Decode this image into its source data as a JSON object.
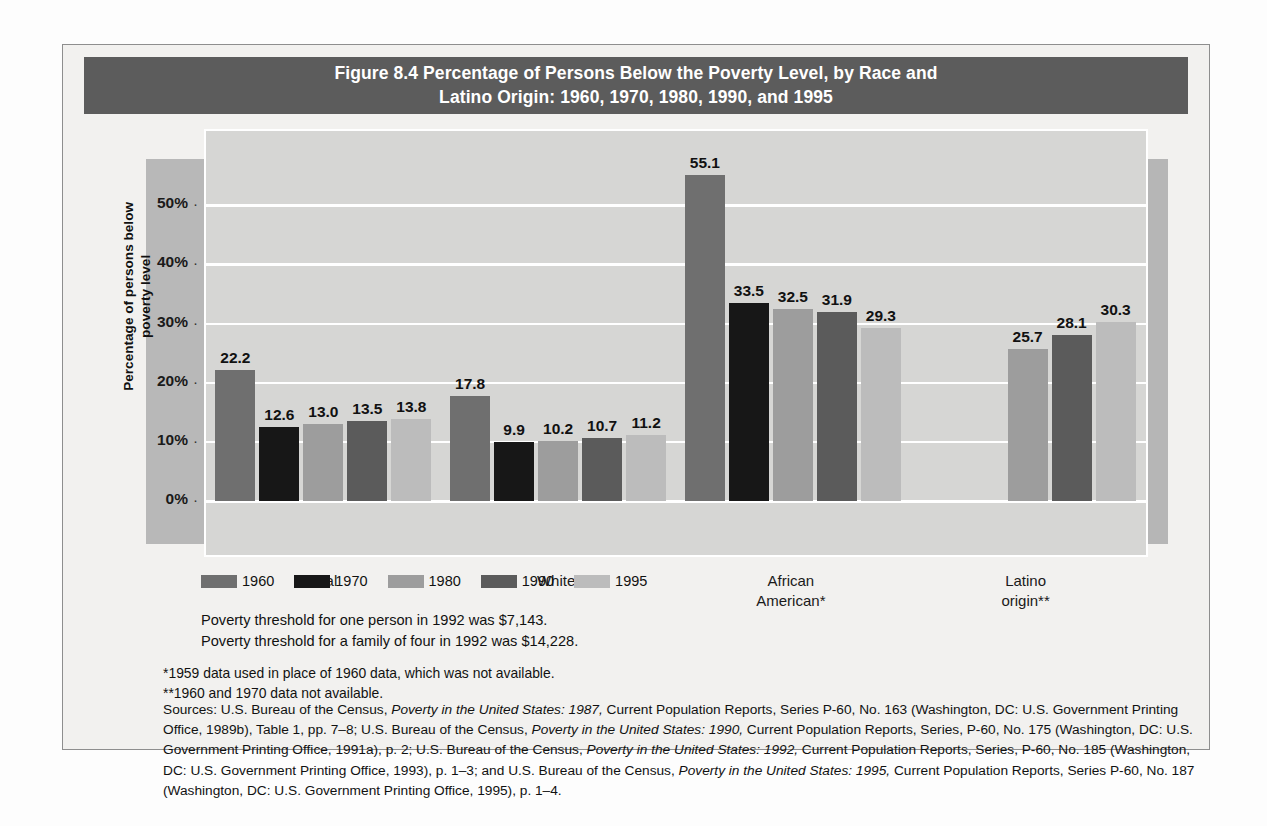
{
  "figure": {
    "title": "Figure 8.4  Percentage of Persons Below the Poverty Level, by Race and Latino Origin: 1960, 1970, 1980, 1990, and 1995",
    "title_line1": "Figure 8.4  Percentage of Persons Below the Poverty Level, by Race and",
    "title_line2": "Latino Origin: 1960, 1970, 1980, 1990, and 1995",
    "title_bg": "#5c5c5c",
    "title_color": "#ffffff"
  },
  "axis": {
    "ylabel_line1": "Percentage of persons below",
    "ylabel_line2": "poverty level",
    "yticks": [
      "0%",
      "10%",
      "20%",
      "30%",
      "40%",
      "50%"
    ],
    "ytick_values": [
      0,
      10,
      20,
      30,
      40,
      50
    ]
  },
  "legend": {
    "items": [
      {
        "label": "1960",
        "color": "#6f6f6f"
      },
      {
        "label": "1970",
        "color": "#171717"
      },
      {
        "label": "1980",
        "color": "#9d9d9d"
      },
      {
        "label": "1990",
        "color": "#5b5b5b"
      },
      {
        "label": "1995",
        "color": "#bcbcbc"
      }
    ]
  },
  "notes": {
    "threshold_line1": "Poverty threshold for one person in 1992 was $7,143.",
    "threshold_line2": "Poverty threshold for a family of four in 1992 was $14,228.",
    "footnote1": "*1959 data used in place of 1960 data, which was not available.",
    "footnote2": "**1960 and 1970 data not available.",
    "sources_prefix": "Sources: U.S. Bureau of the Census, ",
    "sources_it1": "Poverty in the United States: 1987,",
    "sources_t1": " Current Population Reports, Series P-60, No. 163 (Washington, DC: U.S. Government Printing Office, 1989b), Table 1, pp. 7–8; U.S. Bureau of the Census, ",
    "sources_it2": "Poverty in the United States: 1990,",
    "sources_t2": " Current Population Reports, Series, P-60, No. 175 (Washington, DC: U.S. Government Printing Office, 1991a), p. 2; U.S. Bureau of the Census, ",
    "sources_it3": "Poverty in the United States: 1992,",
    "sources_t3": " Current Population Reports, Series, P-60, No. 185 (Washington, DC: U.S. Government Printing Office, 1993), p. 1–3; and U.S. Bureau of the Census, ",
    "sources_it4": "Poverty in the United States: 1995,",
    "sources_t4": " Current Population Reports, Series P-60, No. 187 (Washington, DC: U.S. Government Printing Office, 1995), p. 1–4."
  },
  "chart_data": {
    "type": "bar",
    "title": "Figure 8.4  Percentage of Persons Below the Poverty Level, by Race and Latino Origin: 1960, 1970, 1980, 1990, and 1995",
    "xlabel": "",
    "ylabel": "Percentage of persons below poverty level",
    "ylim": [
      0,
      55
    ],
    "yticks": [
      0,
      10,
      20,
      30,
      40,
      50
    ],
    "ytick_labels": [
      "0%",
      "10%",
      "20%",
      "30%",
      "40%",
      "50%"
    ],
    "grid": true,
    "legend_position": "below-left",
    "categories": [
      "Total",
      "White",
      "African American*",
      "Latino origin**"
    ],
    "series": [
      {
        "name": "1960",
        "color": "#6f6f6f",
        "values": [
          22.2,
          17.8,
          55.1,
          null
        ]
      },
      {
        "name": "1970",
        "color": "#171717",
        "values": [
          12.6,
          9.9,
          33.5,
          null
        ]
      },
      {
        "name": "1980",
        "color": "#9d9d9d",
        "values": [
          13.0,
          10.2,
          32.5,
          25.7
        ]
      },
      {
        "name": "1990",
        "color": "#5b5b5b",
        "values": [
          13.5,
          10.7,
          31.9,
          28.1
        ]
      },
      {
        "name": "1995",
        "color": "#bcbcbc",
        "values": [
          13.8,
          11.2,
          29.3,
          30.3
        ]
      }
    ],
    "annotations": [
      "*1959 data used in place of 1960 data, which was not available.",
      "**1960 and 1970 data not available.",
      "Poverty threshold for one person in 1992 was $7,143.",
      "Poverty threshold for a family of four in 1992 was $14,228."
    ]
  }
}
